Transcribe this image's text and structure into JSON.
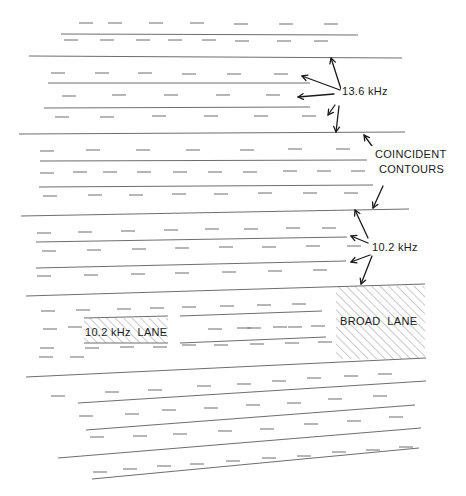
{
  "colors": {
    "background": "#ffffff",
    "contour_line": "#6e6e6e",
    "dash_line": "#7a7a7a",
    "ink": "#1a1a1a",
    "hatch": "#8a8a8a"
  },
  "labels": {
    "spacing_wide": "13.6 kHz",
    "coincident_line1": "COINCIDENT",
    "coincident_line2": "CONTOURS",
    "spacing_narrow": "10.2 kHz",
    "lane_narrow": "10.2 kHz  LANE",
    "lane_broad": "BROAD  LANE"
  },
  "solid_lines": [
    [
      61,
      34,
      358,
      35
    ],
    [
      29,
      56,
      402,
      58
    ],
    [
      48,
      83,
      310,
      83
    ],
    [
      44,
      108,
      310,
      107
    ],
    [
      19,
      134,
      405,
      132
    ],
    [
      40,
      161,
      367,
      160
    ],
    [
      39,
      187,
      373,
      185
    ],
    [
      21,
      216,
      409,
      209
    ],
    [
      36,
      242,
      347,
      237
    ],
    [
      36,
      268,
      346,
      261
    ],
    [
      26,
      296,
      425,
      284
    ],
    [
      84,
      318,
      168,
      316
    ],
    [
      180,
      316,
      322,
      311
    ],
    [
      180,
      343,
      326,
      337
    ],
    [
      84,
      343,
      168,
      343
    ],
    [
      26,
      377,
      426,
      358
    ],
    [
      78,
      403,
      426,
      381
    ],
    [
      86,
      430,
      415,
      405
    ],
    [
      58,
      458,
      421,
      428
    ],
    [
      92,
      479,
      419,
      448
    ]
  ],
  "dashed_lines": [
    [
      [
        79,
        23
      ],
      [
        108,
        23
      ],
      [
        149,
        23
      ],
      [
        190,
        23
      ],
      [
        234,
        24
      ],
      [
        279,
        24
      ],
      [
        324,
        24
      ]
    ],
    [
      [
        64,
        40
      ],
      [
        100,
        40
      ],
      [
        136,
        40
      ],
      [
        168,
        40
      ],
      [
        202,
        40
      ],
      [
        235,
        41
      ],
      [
        277,
        41
      ],
      [
        314,
        41
      ]
    ],
    [
      [
        51,
        73
      ],
      [
        95,
        73
      ],
      [
        138,
        73
      ],
      [
        182,
        74
      ],
      [
        227,
        74
      ],
      [
        274,
        74
      ]
    ],
    [
      [
        62,
        96
      ],
      [
        112,
        95
      ],
      [
        164,
        95
      ],
      [
        216,
        95
      ],
      [
        266,
        95
      ]
    ],
    [
      [
        55,
        117
      ],
      [
        100,
        117
      ],
      [
        152,
        116
      ],
      [
        204,
        116
      ],
      [
        254,
        116
      ],
      [
        302,
        116
      ]
    ],
    [
      [
        40,
        151
      ],
      [
        86,
        150
      ],
      [
        136,
        150
      ],
      [
        186,
        150
      ],
      [
        240,
        150
      ],
      [
        288,
        149
      ],
      [
        336,
        149
      ]
    ],
    [
      [
        40,
        173
      ],
      [
        73,
        172
      ],
      [
        103,
        172
      ],
      [
        137,
        172
      ],
      [
        173,
        172
      ],
      [
        208,
        172
      ],
      [
        243,
        172
      ],
      [
        283,
        171
      ],
      [
        317,
        171
      ],
      [
        351,
        171
      ]
    ],
    [
      [
        43,
        196
      ],
      [
        88,
        195
      ],
      [
        129,
        195
      ],
      [
        172,
        194
      ],
      [
        214,
        194
      ],
      [
        258,
        193
      ],
      [
        303,
        193
      ],
      [
        344,
        193
      ]
    ],
    [
      [
        37,
        233
      ],
      [
        78,
        232
      ],
      [
        121,
        231
      ],
      [
        164,
        230
      ],
      [
        205,
        229
      ],
      [
        244,
        229
      ],
      [
        286,
        228
      ],
      [
        322,
        228
      ]
    ],
    [
      [
        42,
        251
      ],
      [
        87,
        250
      ],
      [
        132,
        249
      ],
      [
        175,
        248
      ],
      [
        219,
        247
      ],
      [
        262,
        247
      ],
      [
        306,
        246
      ],
      [
        347,
        246
      ]
    ],
    [
      [
        37,
        276
      ],
      [
        84,
        275
      ],
      [
        131,
        274
      ],
      [
        175,
        273
      ],
      [
        222,
        272
      ],
      [
        268,
        271
      ],
      [
        313,
        270
      ]
    ],
    [
      [
        41,
        311
      ],
      [
        76,
        310
      ],
      [
        117,
        309
      ],
      [
        150,
        308
      ],
      [
        182,
        307
      ],
      [
        220,
        306
      ],
      [
        257,
        305
      ],
      [
        292,
        304
      ]
    ],
    [
      [
        43,
        329
      ],
      [
        68,
        327
      ]
    ],
    [
      [
        208,
        329
      ],
      [
        237,
        328
      ],
      [
        247,
        328
      ],
      [
        273,
        327
      ],
      [
        288,
        327
      ],
      [
        311,
        326
      ]
    ],
    [
      [
        40,
        348
      ],
      [
        85,
        348
      ],
      [
        120,
        347
      ],
      [
        153,
        347
      ],
      [
        182,
        345
      ],
      [
        214,
        345
      ],
      [
        250,
        344
      ],
      [
        285,
        343
      ],
      [
        318,
        342
      ]
    ],
    [
      [
        39,
        357
      ],
      [
        70,
        357
      ]
    ],
    [
      [
        51,
        396
      ],
      [
        105,
        392
      ],
      [
        148,
        390
      ],
      [
        197,
        386
      ],
      [
        237,
        384
      ],
      [
        272,
        381
      ],
      [
        307,
        378
      ],
      [
        344,
        376
      ],
      [
        378,
        374
      ]
    ],
    [
      [
        79,
        416
      ],
      [
        125,
        414
      ],
      [
        162,
        410
      ],
      [
        204,
        408
      ],
      [
        246,
        405
      ],
      [
        287,
        403
      ],
      [
        328,
        399
      ],
      [
        373,
        396
      ]
    ],
    [
      [
        90,
        437
      ],
      [
        133,
        436
      ],
      [
        173,
        434
      ],
      [
        218,
        431
      ],
      [
        260,
        429
      ],
      [
        304,
        424
      ],
      [
        347,
        421
      ],
      [
        389,
        417
      ]
    ],
    [
      [
        93,
        472
      ],
      [
        123,
        469
      ],
      [
        157,
        466
      ],
      [
        190,
        464
      ],
      [
        226,
        461
      ],
      [
        262,
        458
      ],
      [
        297,
        456
      ],
      [
        332,
        452
      ],
      [
        366,
        450
      ],
      [
        399,
        447
      ]
    ]
  ],
  "arrows_13_6": [
    [
      341,
      89,
      331,
      58
    ],
    [
      340,
      90,
      302,
      76
    ],
    [
      334,
      94,
      298,
      97
    ],
    [
      335,
      105,
      328,
      115
    ],
    [
      339,
      106,
      336,
      132
    ]
  ],
  "arrows_coincident": [
    [
      377,
      153,
      364,
      135
    ],
    [
      383,
      186,
      373,
      208
    ]
  ],
  "arrows_10_2": [
    [
      368,
      238,
      355,
      210
    ],
    [
      368,
      243,
      351,
      236
    ],
    [
      370,
      255,
      351,
      262
    ],
    [
      372,
      256,
      361,
      284
    ]
  ],
  "hatch_regions": {
    "narrow_lane": [
      84,
      318,
      84,
      25
    ],
    "broad_lane": [
      336,
      286,
      89,
      73
    ]
  }
}
